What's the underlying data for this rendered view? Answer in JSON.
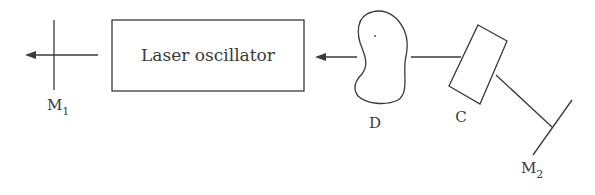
{
  "diagram": {
    "type": "optical setup",
    "components": {
      "mirror1": {
        "label": "M",
        "subscript": "1"
      },
      "oscillator": {
        "label": "Laser oscillator"
      },
      "sample": {
        "label": "D"
      },
      "crystal": {
        "label": "C"
      },
      "mirror2": {
        "label": "M",
        "subscript": "2"
      }
    },
    "beam_direction": "right-to-left",
    "stroke_color": "#3a3a3a"
  }
}
